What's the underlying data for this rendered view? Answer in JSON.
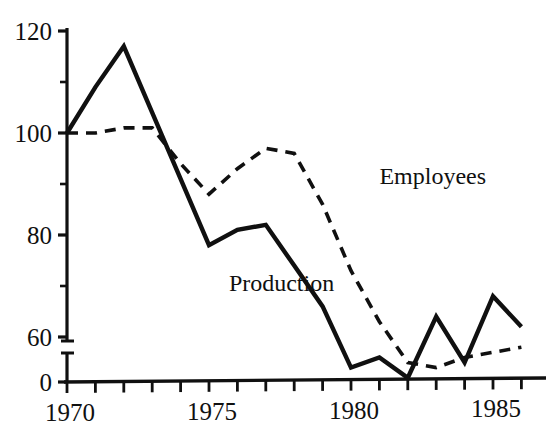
{
  "chart_data": {
    "type": "line",
    "title": "",
    "subtitle": "",
    "xlabel": "",
    "ylabel": "",
    "grid": false,
    "legend_position": "inline-annotation",
    "x": [
      1970,
      1971,
      1972,
      1973,
      1974,
      1975,
      1976,
      1977,
      1978,
      1979,
      1980,
      1981,
      1982,
      1983,
      1984,
      1985,
      1986
    ],
    "xlim": [
      1970,
      1986
    ],
    "ylim": [
      0,
      120
    ],
    "y_axis_break": true,
    "y_axis_break_between": [
      0,
      60
    ],
    "xticks": [
      1970,
      1971,
      1972,
      1973,
      1974,
      1975,
      1976,
      1977,
      1978,
      1979,
      1980,
      1981,
      1982,
      1983,
      1984,
      1985,
      1986
    ],
    "xtick_labels": [
      "1970",
      "",
      "",
      "",
      "",
      "1975",
      "",
      "",
      "",
      "",
      "1980",
      "",
      "",
      "",
      "",
      "1985",
      ""
    ],
    "yticks": [
      0,
      60,
      70,
      80,
      90,
      100,
      110,
      120
    ],
    "ytick_labels": [
      "0",
      "60",
      "",
      "80",
      "",
      "100",
      "",
      "120"
    ],
    "series": [
      {
        "name": "Production",
        "style": "solid",
        "color": "#101010",
        "values": [
          100,
          109,
          117,
          104,
          91,
          78,
          81,
          82,
          74,
          66,
          54,
          56,
          52,
          64,
          55,
          68,
          62
        ]
      },
      {
        "name": "Employees",
        "style": "dashed",
        "color": "#101010",
        "values": [
          100,
          100,
          101,
          101,
          94,
          88,
          93,
          97,
          96,
          86,
          73,
          63,
          55,
          54,
          56,
          57,
          58
        ]
      }
    ],
    "annotations": [
      {
        "text": "Employees",
        "x": 1981,
        "y": 90
      },
      {
        "text": "Production",
        "x": 1975.7,
        "y": 69
      }
    ]
  }
}
